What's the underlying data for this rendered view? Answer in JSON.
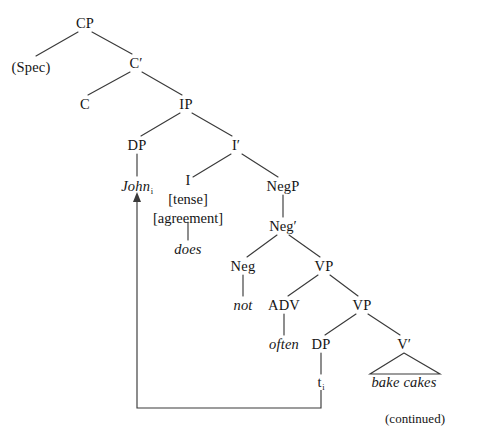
{
  "figure": {
    "type": "x-bar-syntax-tree",
    "sentence": "John does not often bake cakes",
    "continued_note": "(continued)",
    "ink_color": "#3a3a3a",
    "text_color": "#151515",
    "background_color": "#ffffff"
  },
  "nodes": {
    "cp": "CP",
    "spec": "(Spec)",
    "cbar": "C′",
    "c": "C",
    "ip": "IP",
    "dp_subject": "DP",
    "ibar": "I′",
    "john": "John",
    "john_subscript": "i",
    "i_head": "I",
    "i_tense": "[tense]",
    "i_agreement": "[agreement]",
    "does": "does",
    "negp": "NegP",
    "negbar": "Neg′",
    "neg": "Neg",
    "not": "not",
    "vp_upper": "VP",
    "adv": "ADV",
    "often": "often",
    "vp_lower": "VP",
    "dp_object_trace": "DP",
    "trace": "t",
    "trace_subscript": "i",
    "vbar": "V′",
    "bake_cakes": "bake cakes"
  },
  "layout": {
    "positions": {
      "cp": {
        "x": 85,
        "y": 23
      },
      "spec": {
        "x": 31,
        "y": 67
      },
      "cbar": {
        "x": 136,
        "y": 63
      },
      "c": {
        "x": 85,
        "y": 104
      },
      "ip": {
        "x": 186,
        "y": 104
      },
      "dp_subject": {
        "x": 137,
        "y": 145
      },
      "ibar": {
        "x": 236,
        "y": 145
      },
      "john": {
        "x": 137,
        "y": 186
      },
      "i_head": {
        "x": 188,
        "y": 186
      },
      "negp": {
        "x": 283,
        "y": 186
      },
      "does": {
        "x": 188,
        "y": 249
      },
      "negbar": {
        "x": 283,
        "y": 226
      },
      "neg": {
        "x": 243,
        "y": 266
      },
      "vp_upper": {
        "x": 324,
        "y": 266
      },
      "not": {
        "x": 243,
        "y": 305
      },
      "adv": {
        "x": 284,
        "y": 305
      },
      "vp_lower": {
        "x": 362,
        "y": 305
      },
      "often": {
        "x": 284,
        "y": 344
      },
      "dp_object": {
        "x": 321,
        "y": 344
      },
      "vbar": {
        "x": 404,
        "y": 344
      },
      "trace": {
        "x": 321,
        "y": 382
      },
      "bake_cakes": {
        "x": 404,
        "y": 382
      }
    },
    "movement_arrow": {
      "from": "trace",
      "to": "john",
      "path_y_bottom": 408,
      "x_left": 137,
      "x_right": 321
    },
    "triangle": {
      "apex_x": 404,
      "apex_y": 353,
      "left_x": 370,
      "right_x": 440,
      "base_y": 374
    },
    "continued_note_position": {
      "x": 415,
      "y": 418
    }
  }
}
